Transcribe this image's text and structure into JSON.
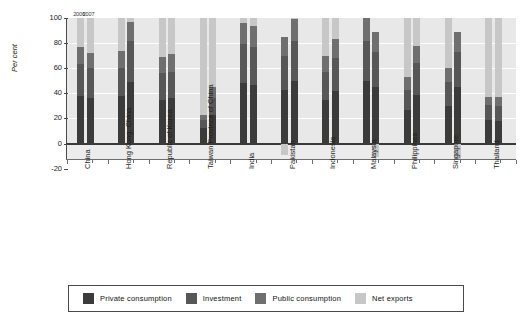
{
  "chart_data": {
    "type": "bar",
    "title": "",
    "subtitle": "",
    "xlabel": "",
    "ylabel": "Per cent",
    "ylim": [
      -20,
      100
    ],
    "yticks": [
      -20,
      0,
      20,
      40,
      60,
      80,
      100
    ],
    "ytick_labels": [
      "-20",
      "0",
      "20",
      "40",
      "60",
      "80",
      "100"
    ],
    "grid": true,
    "grid_color": "#ffffff",
    "plot_bg": "#e8e8e8",
    "stacked": true,
    "legend_position": "bottom",
    "series_order": [
      "Private consumption",
      "Investment",
      "Public consumption",
      "Net exports"
    ],
    "series_colors": [
      "#3b3b3b",
      "#575757",
      "#6f6f6f",
      "#c7c7c7"
    ],
    "group_annotations": [
      "2006",
      "2007"
    ],
    "categories": [
      "China",
      "Hong Kong, China",
      "Republic of Korea",
      "Taiwan Province of China",
      "India",
      "Pakistan",
      "Indonesia",
      "Malaysia",
      "Philippines",
      "Singapore",
      "Thailand"
    ],
    "groups": [
      {
        "category": "China",
        "bars": [
          {
            "year": "2006",
            "segments": [
              {
                "name": "Private consumption",
                "value": 38
              },
              {
                "name": "Investment",
                "value": 25
              },
              {
                "name": "Public consumption",
                "value": 14
              },
              {
                "name": "Net exports",
                "value": 23
              }
            ],
            "total": 100
          },
          {
            "year": "2007",
            "segments": [
              {
                "name": "Private consumption",
                "value": 36
              },
              {
                "name": "Investment",
                "value": 24
              },
              {
                "name": "Public consumption",
                "value": 12
              },
              {
                "name": "Net exports",
                "value": 28
              }
            ],
            "total": 100
          }
        ]
      },
      {
        "category": "Hong Kong, China",
        "bars": [
          {
            "year": "2006",
            "segments": [
              {
                "name": "Private consumption",
                "value": 38
              },
              {
                "name": "Investment",
                "value": 22
              },
              {
                "name": "Public consumption",
                "value": 14
              },
              {
                "name": "Net exports",
                "value": 26
              }
            ],
            "total": 100
          },
          {
            "year": "2007",
            "segments": [
              {
                "name": "Private consumption",
                "value": 49
              },
              {
                "name": "Investment",
                "value": 33
              },
              {
                "name": "Public consumption",
                "value": 15
              },
              {
                "name": "Net exports",
                "value": 3
              }
            ],
            "total": 100
          }
        ]
      },
      {
        "category": "Republic of Korea",
        "bars": [
          {
            "year": "2006",
            "segments": [
              {
                "name": "Private consumption",
                "value": 35
              },
              {
                "name": "Investment",
                "value": 21
              },
              {
                "name": "Public consumption",
                "value": 13
              },
              {
                "name": "Net exports",
                "value": 31
              }
            ],
            "total": 100
          },
          {
            "year": "2007",
            "segments": [
              {
                "name": "Private consumption",
                "value": 36
              },
              {
                "name": "Investment",
                "value": 21
              },
              {
                "name": "Public consumption",
                "value": 14
              },
              {
                "name": "Net exports",
                "value": 29
              }
            ],
            "total": 100
          }
        ]
      },
      {
        "category": "Taiwan Province of China",
        "bars": [
          {
            "year": "2006",
            "segments": [
              {
                "name": "Private consumption",
                "value": 12
              },
              {
                "name": "Investment",
                "value": 7
              },
              {
                "name": "Public consumption",
                "value": 4
              },
              {
                "name": "Net exports",
                "value": 77
              }
            ],
            "total": 100
          },
          {
            "year": "2007",
            "segments": [
              {
                "name": "Private consumption",
                "value": 23
              },
              {
                "name": "Investment",
                "value": 13
              },
              {
                "name": "Public consumption",
                "value": 9
              },
              {
                "name": "Net exports",
                "value": 55
              }
            ],
            "total": 100
          }
        ]
      },
      {
        "category": "India",
        "bars": [
          {
            "year": "2006",
            "segments": [
              {
                "name": "Private consumption",
                "value": 48
              },
              {
                "name": "Investment",
                "value": 31
              },
              {
                "name": "Public consumption",
                "value": 17
              },
              {
                "name": "Net exports",
                "value": 4
              }
            ],
            "total": 100
          },
          {
            "year": "2007",
            "segments": [
              {
                "name": "Private consumption",
                "value": 47
              },
              {
                "name": "Investment",
                "value": 30
              },
              {
                "name": "Public consumption",
                "value": 17
              },
              {
                "name": "Net exports",
                "value": 6
              }
            ],
            "total": 100
          }
        ]
      },
      {
        "category": "Pakistan",
        "bars": [
          {
            "year": "2006",
            "segments": [
              {
                "name": "Private consumption",
                "value": 43
              },
              {
                "name": "Investment",
                "value": 27
              },
              {
                "name": "Public consumption",
                "value": 15
              },
              {
                "name": "Net exports",
                "value": -9
              }
            ],
            "total": 85
          },
          {
            "year": "2007",
            "segments": [
              {
                "name": "Private consumption",
                "value": 50
              },
              {
                "name": "Investment",
                "value": 32
              },
              {
                "name": "Public consumption",
                "value": 17
              },
              {
                "name": "Net exports",
                "value": 1
              }
            ],
            "total": 100
          }
        ]
      },
      {
        "category": "Indonesia",
        "bars": [
          {
            "year": "2006",
            "segments": [
              {
                "name": "Private consumption",
                "value": 35
              },
              {
                "name": "Investment",
                "value": 22
              },
              {
                "name": "Public consumption",
                "value": 13
              },
              {
                "name": "Net exports",
                "value": 30
              }
            ],
            "total": 100
          },
          {
            "year": "2007",
            "segments": [
              {
                "name": "Private consumption",
                "value": 42
              },
              {
                "name": "Investment",
                "value": 26
              },
              {
                "name": "Public consumption",
                "value": 15
              },
              {
                "name": "Net exports",
                "value": 17
              }
            ],
            "total": 100
          }
        ]
      },
      {
        "category": "Malaysia",
        "bars": [
          {
            "year": "2006",
            "segments": [
              {
                "name": "Private consumption",
                "value": 50
              },
              {
                "name": "Investment",
                "value": 32
              },
              {
                "name": "Public consumption",
                "value": 18
              },
              {
                "name": "Net exports",
                "value": 0
              }
            ],
            "total": 100
          },
          {
            "year": "2007",
            "segments": [
              {
                "name": "Private consumption",
                "value": 45
              },
              {
                "name": "Investment",
                "value": 28
              },
              {
                "name": "Public consumption",
                "value": 16
              },
              {
                "name": "Net exports",
                "value": -11
              }
            ],
            "total": 89
          }
        ]
      },
      {
        "category": "Philippines",
        "bars": [
          {
            "year": "2006",
            "segments": [
              {
                "name": "Private consumption",
                "value": 27
              },
              {
                "name": "Investment",
                "value": 16
              },
              {
                "name": "Public consumption",
                "value": 10
              },
              {
                "name": "Net exports",
                "value": 47
              }
            ],
            "total": 100
          },
          {
            "year": "2007",
            "segments": [
              {
                "name": "Private consumption",
                "value": 39
              },
              {
                "name": "Investment",
                "value": 25
              },
              {
                "name": "Public consumption",
                "value": 14
              },
              {
                "name": "Net exports",
                "value": 22
              }
            ],
            "total": 100
          }
        ]
      },
      {
        "category": "Singapore",
        "bars": [
          {
            "year": "2006",
            "segments": [
              {
                "name": "Private consumption",
                "value": 30
              },
              {
                "name": "Investment",
                "value": 19
              },
              {
                "name": "Public consumption",
                "value": 11
              },
              {
                "name": "Net exports",
                "value": 40
              }
            ],
            "total": 100
          },
          {
            "year": "2007",
            "segments": [
              {
                "name": "Private consumption",
                "value": 45
              },
              {
                "name": "Investment",
                "value": 28
              },
              {
                "name": "Public consumption",
                "value": 16
              },
              {
                "name": "Net exports",
                "value": -13
              }
            ],
            "total": 89
          }
        ]
      },
      {
        "category": "Thailand",
        "bars": [
          {
            "year": "2006",
            "segments": [
              {
                "name": "Private consumption",
                "value": 19
              },
              {
                "name": "Investment",
                "value": 12
              },
              {
                "name": "Public consumption",
                "value": 6
              },
              {
                "name": "Net exports",
                "value": 63
              }
            ],
            "total": 100
          },
          {
            "year": "2007",
            "segments": [
              {
                "name": "Private consumption",
                "value": 18
              },
              {
                "name": "Investment",
                "value": 12
              },
              {
                "name": "Public consumption",
                "value": 7
              },
              {
                "name": "Net exports",
                "value": 63
              }
            ],
            "total": 100
          }
        ]
      }
    ]
  },
  "legend": {
    "items": [
      {
        "label": "Private consumption",
        "color": "#3b3b3b",
        "swatch_class": "sw-priv"
      },
      {
        "label": "Investment",
        "color": "#575757",
        "swatch_class": "sw-inv"
      },
      {
        "label": "Public consumption",
        "color": "#6f6f6f",
        "swatch_class": "sw-pub"
      },
      {
        "label": "Net exports",
        "color": "#c7c7c7",
        "swatch_class": "sw-net"
      }
    ]
  }
}
